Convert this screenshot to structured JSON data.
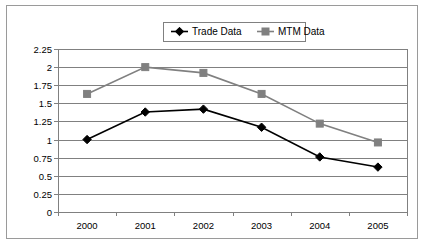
{
  "chart_data": {
    "type": "line",
    "title": "",
    "xlabel": "",
    "ylabel": "",
    "categories": [
      "2000",
      "2001",
      "2002",
      "2003",
      "2004",
      "2005"
    ],
    "series": [
      {
        "name": "Trade Data",
        "color": "#000000",
        "marker": "diamond",
        "values": [
          1.0,
          1.38,
          1.42,
          1.17,
          0.76,
          0.62
        ]
      },
      {
        "name": "MTM Data",
        "color": "#808080",
        "marker": "square",
        "values": [
          1.63,
          2.0,
          1.92,
          1.63,
          1.22,
          0.96
        ]
      }
    ],
    "ylim": [
      0,
      2.25
    ],
    "yticks": [
      "0",
      "0.25",
      "0.5",
      "0.75",
      "1",
      "1.25",
      "1.5",
      "1.75",
      "2",
      "2.25"
    ],
    "ytick_values": [
      0,
      0.25,
      0.5,
      0.75,
      1,
      1.25,
      1.5,
      1.75,
      2,
      2.25
    ],
    "grid": true,
    "legend_position": "top-center"
  },
  "legend": {
    "entries": [
      {
        "label": "Trade Data",
        "marker_icon": "diamond-marker-icon"
      },
      {
        "label": "MTM Data",
        "marker_icon": "square-marker-icon"
      }
    ]
  }
}
